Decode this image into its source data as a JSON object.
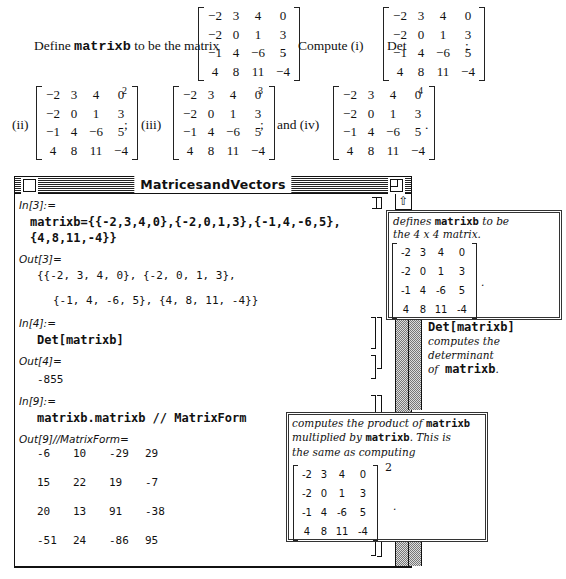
{
  "problem": {
    "intro_prefix": "Define",
    "variable": "matrixb",
    "intro_suffix": "to be the matrix",
    "compute_label": "Compute (i)",
    "det_label": "Det",
    "semicolon": ";",
    "period": ".",
    "part_ii": "(ii)",
    "part_iii": "(iii)",
    "and_iv": "and (iv)",
    "exp_2": "2",
    "exp_3": "3",
    "exp_4": "4",
    "matrix": [
      [
        "−2",
        "3",
        "4",
        "0"
      ],
      [
        "−2",
        "0",
        "1",
        "3"
      ],
      [
        "−1",
        "4",
        "−6",
        "5"
      ],
      [
        "4",
        "8",
        "11",
        "−4"
      ]
    ]
  },
  "window": {
    "title": "MatricesandVectors",
    "close_icon": "close-box",
    "zoom_icon": "zoom-box",
    "scroll_up_icon": "⇧"
  },
  "cells": {
    "in3_label": "In[3]:=",
    "in3_line1": "matrixb={{-2,3,4,0},{-2,0,1,3},{-1,4,-6,5},",
    "in3_line2": "{4,8,11,-4}}",
    "out3_label": "Out[3]=",
    "out3_line1": "{{-2, 3, 4, 0}, {-2, 0, 1, 3},",
    "out3_line2": "{-1, 4, -6, 5}, {4, 8, 11, -4}}",
    "in4_label": "In[4]:=",
    "in4_code": "Det[matrixb]",
    "out4_label": "Out[4]=",
    "out4_value": "-855",
    "in9_label": "In[9]:=",
    "in9_code": "matrixb.matrixb // MatrixForm",
    "out9_label": "Out[9]//MatrixForm=",
    "out9_matrix": [
      [
        "-6",
        "10",
        "-29",
        "29"
      ],
      [
        "15",
        "22",
        "19",
        "-7"
      ],
      [
        "20",
        "13",
        "91",
        "-38"
      ],
      [
        "-51",
        "24",
        "-86",
        "95"
      ]
    ]
  },
  "callouts": {
    "define": {
      "text_a": "defines",
      "code": "matrixb",
      "text_b": "to be",
      "text_c": "the 4 x 4 matrix.",
      "matrix": [
        [
          "-2",
          "3",
          "4",
          "0"
        ],
        [
          "-2",
          "0",
          "1",
          "3"
        ],
        [
          "-1",
          "4",
          "-6",
          "5"
        ],
        [
          "4",
          "8",
          "11",
          "-4"
        ]
      ],
      "period": "."
    },
    "det": {
      "code": "Det[matrixb]",
      "text_a": "computes the determinant",
      "text_b": "of",
      "code2": "matrixb",
      "period": "."
    },
    "product": {
      "text_a": "computes the product of",
      "code": "matrixb",
      "text_b": "multiplied by",
      "code2": "matrixb",
      "text_c": ". This is",
      "text_d": "the same as computing",
      "matrix": [
        [
          "-2",
          "3",
          "4",
          "0"
        ],
        [
          "-2",
          "0",
          "1",
          "3"
        ],
        [
          "-1",
          "4",
          "-6",
          "5"
        ],
        [
          "4",
          "8",
          "11",
          "-4"
        ]
      ],
      "exponent": "2",
      "period": "."
    }
  }
}
